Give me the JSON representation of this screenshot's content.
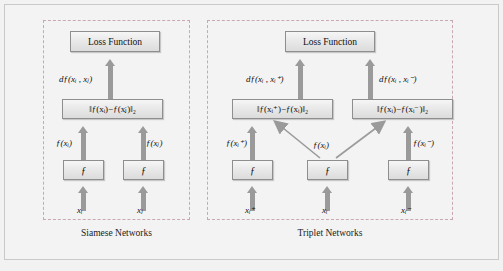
{
  "figure": {
    "background_color": "#f3f3f3",
    "panel_border_color": "#c9a8b0",
    "box_fill_color": "#e9e9e9",
    "arrow_color": "#9a9a9a"
  },
  "panels": [
    {
      "id": "siamese",
      "caption": "Siamese Networks",
      "loss_box": "Loss Function",
      "distance_label": "dƒ(xᵢ , xⱼ)",
      "norm_boxes": [
        "‖ƒ(xᵢ)−ƒ(xⱼ)‖₂"
      ],
      "embedding_labels": [
        "ƒ(xᵢ)",
        "ƒ(xⱼ)"
      ],
      "encoder_boxes": [
        "ƒ",
        "ƒ"
      ],
      "inputs": [
        "xᵢ",
        "xⱼ"
      ]
    },
    {
      "id": "triplet",
      "caption": "Triplet Networks",
      "loss_box": "Loss Function",
      "distance_labels": [
        "dƒ(xᵢ , xᵢ⁺)",
        "dƒ(xᵢ , xᵢ⁻)"
      ],
      "norm_boxes": [
        "‖ƒ(xᵢ⁺)−ƒ(xᵢ)‖₂",
        "‖ƒ(xᵢ)−ƒ(xᵢ⁻)‖₂"
      ],
      "embedding_labels": [
        "ƒ(xᵢ⁺)",
        "ƒ(xᵢ)",
        "ƒ(xᵢ⁻)"
      ],
      "encoder_boxes": [
        "ƒ",
        "ƒ",
        "ƒ"
      ],
      "inputs": [
        "xᵢ⁺",
        "xᵢ",
        "xᵢ⁻"
      ]
    }
  ]
}
